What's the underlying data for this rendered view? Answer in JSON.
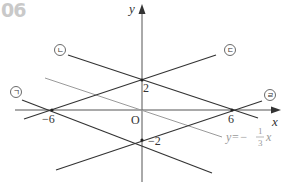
{
  "problem": {
    "number": "06"
  },
  "axes": {
    "x_label": "x",
    "y_label": "y",
    "origin_label": "O"
  },
  "ticks": {
    "x_neg6": "−6",
    "x_6": "6",
    "y_2": "2",
    "y_neg2": "−2"
  },
  "lines": [
    {
      "label": "ㄱ",
      "description": "passes through (-6,0) and (0,-2)"
    },
    {
      "label": "ㄴ",
      "description": "passes through (0,2) and (6,0)"
    },
    {
      "label": "ㄷ",
      "description": "passes through (-6,0) and (0,2)"
    },
    {
      "label": "ㄹ",
      "description": "passes through (0,-2) and (6,0)"
    }
  ],
  "reference_line": {
    "prefix": "y=−",
    "numerator": "1",
    "denominator": "3",
    "var": "x",
    "color": "#9a9a9a"
  },
  "colors": {
    "line": "#333333",
    "reference": "#9a9a9a",
    "problem_number": "#c9c9c9"
  }
}
